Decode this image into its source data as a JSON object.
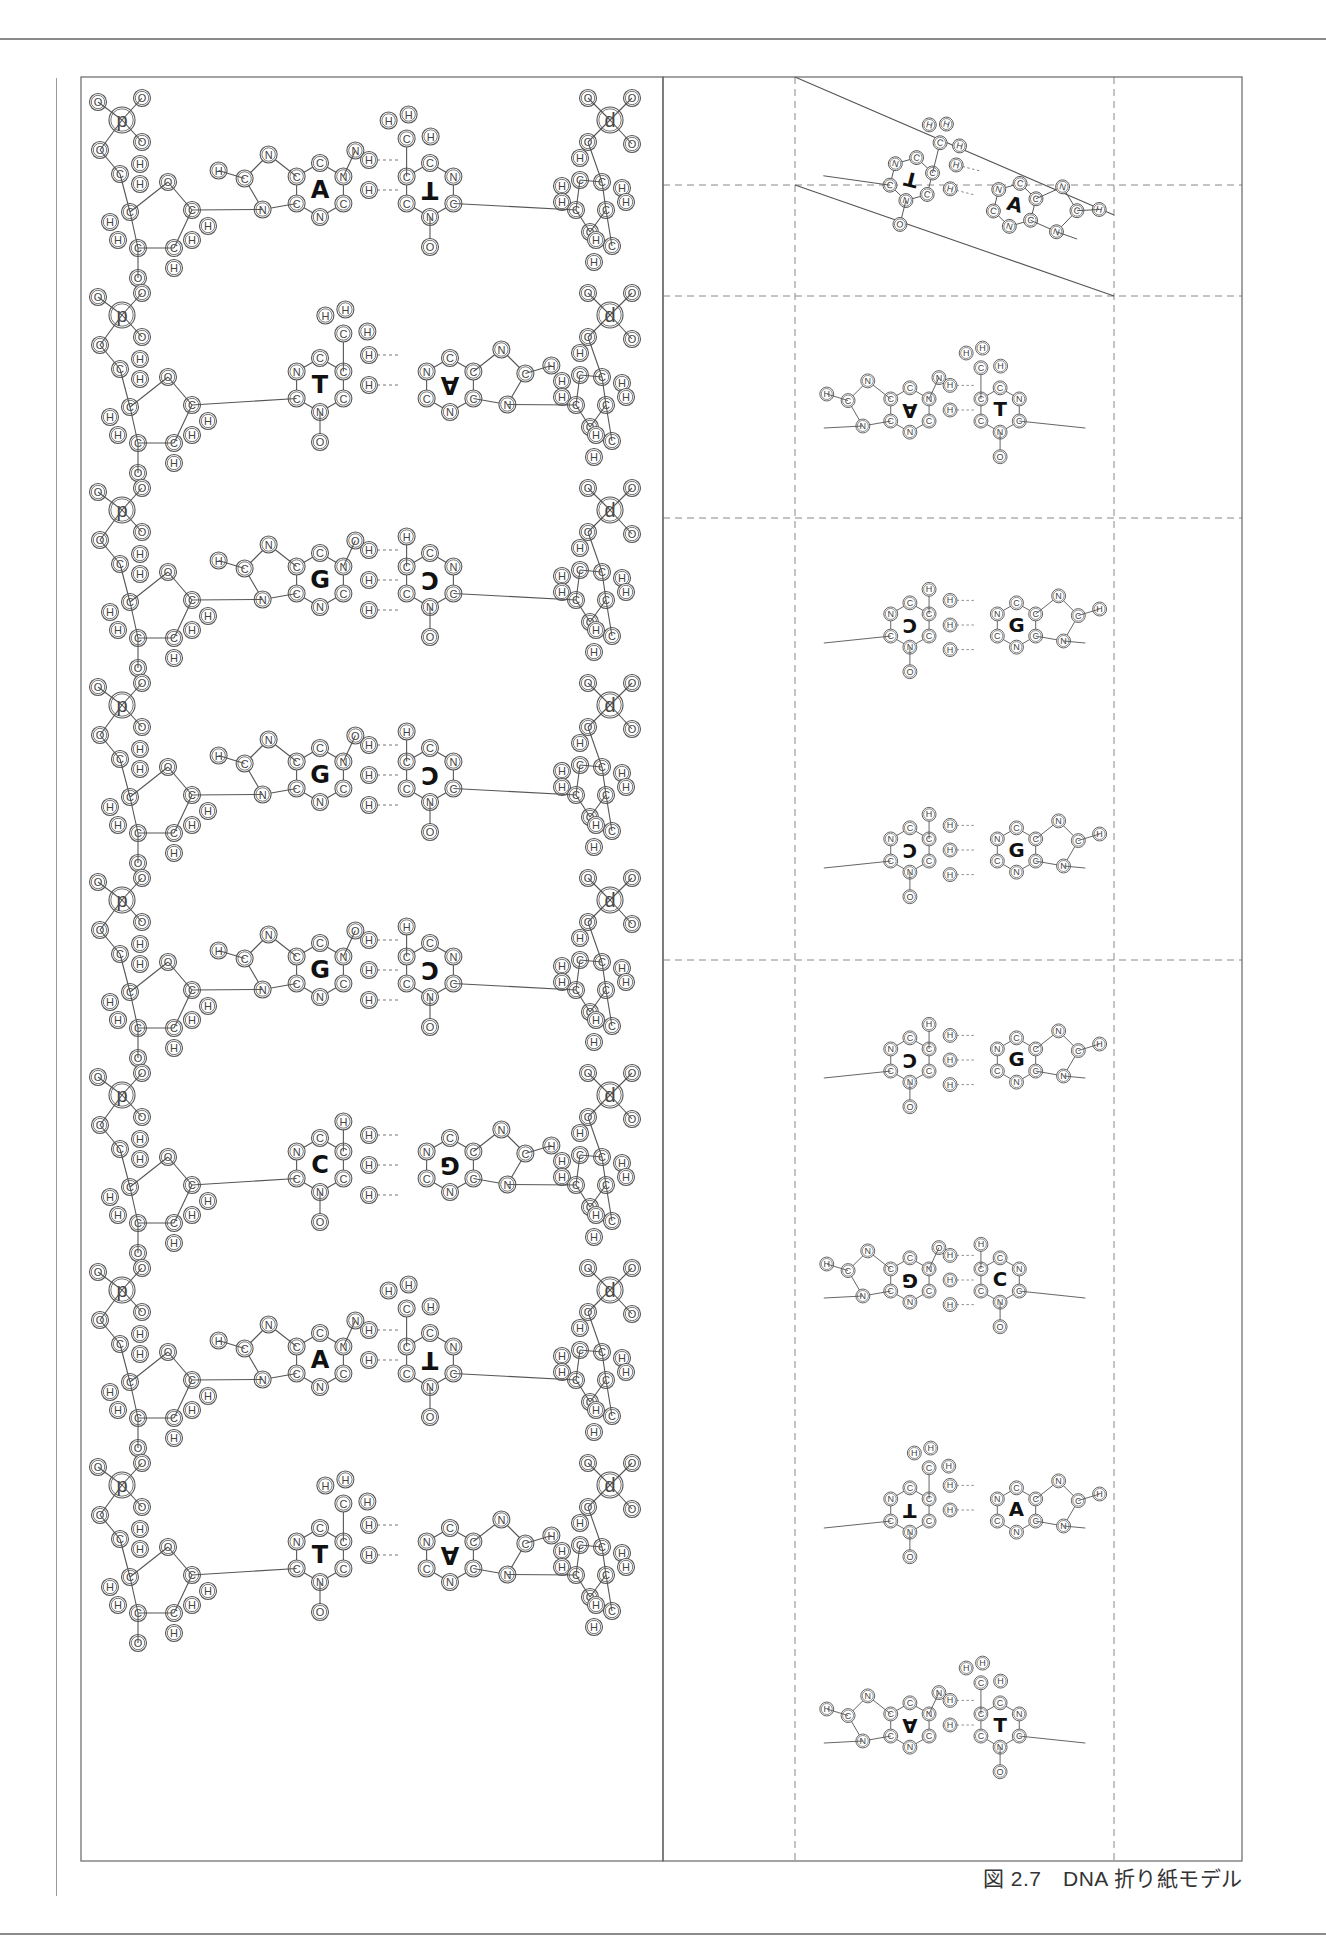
{
  "page": {
    "caption": "図 2.7　DNA 折り紙モデル"
  },
  "figure": {
    "title": "DNA 折り紙モデル",
    "number": "図 2.7",
    "left_panel": {
      "description": "double-strand cut-out model with phosphate backbone",
      "backbone_left_label": "p",
      "backbone_right_label": "d",
      "pairs": [
        {
          "left": "A",
          "right": "T",
          "right_mirrored": true
        },
        {
          "left": "T",
          "right": "A",
          "right_mirrored": true
        },
        {
          "left": "G",
          "right": "C",
          "right_mirrored": true
        },
        {
          "left": "G",
          "right": "C",
          "right_mirrored": true
        },
        {
          "left": "G",
          "right": "C",
          "right_mirrored": true
        },
        {
          "left": "C",
          "right": "G",
          "right_mirrored": true
        },
        {
          "left": "A",
          "right": "T",
          "right_mirrored": true
        },
        {
          "left": "T",
          "right": "A",
          "right_mirrored": true
        }
      ]
    },
    "right_panel": {
      "description": "folded base-pair cards with dashed fold lines",
      "pairs": [
        {
          "left": "T",
          "right": "A",
          "left_mirrored": true,
          "tilted": true
        },
        {
          "left": "A",
          "right": "T",
          "left_mirrored": true
        },
        {
          "left": "C",
          "right": "G",
          "left_mirrored": true
        },
        {
          "left": "C",
          "right": "G",
          "left_mirrored": true
        },
        {
          "left": "C",
          "right": "G",
          "left_mirrored": true
        },
        {
          "left": "G",
          "right": "C",
          "left_mirrored": true
        },
        {
          "left": "T",
          "right": "A",
          "left_mirrored": true
        },
        {
          "left": "A",
          "right": "T",
          "left_mirrored": true
        }
      ]
    },
    "atom_labels": [
      "H",
      "C",
      "N",
      "O",
      "p",
      "d"
    ]
  }
}
